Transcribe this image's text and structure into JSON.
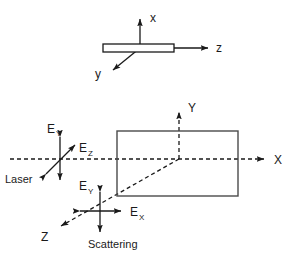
{
  "figure": {
    "background": "#ffffff",
    "ink_color": "#1a1a1a",
    "box_color": "#4a4a4a"
  },
  "panels": {
    "top": {
      "name": "sample-crystal-axes",
      "axes": [
        {
          "key": "x",
          "label": "x",
          "direction": "up"
        },
        {
          "key": "y",
          "label": "y",
          "direction": "down-left"
        },
        {
          "key": "z",
          "label": "z",
          "direction": "right"
        }
      ],
      "sample": {
        "shape": "thin-rectangular-slab"
      }
    },
    "bottom": {
      "name": "laser-scattering-geometry",
      "axes": [
        {
          "key": "X",
          "label": "X",
          "direction": "right",
          "style": "dashed"
        },
        {
          "key": "Y",
          "label": "Y",
          "direction": "up",
          "style": "dashed"
        },
        {
          "key": "Z",
          "label": "Z",
          "direction": "down-left",
          "style": "dashed"
        }
      ],
      "sample_box": {
        "shape": "rectangle"
      },
      "laser": {
        "caption": "Laser",
        "fields": [
          {
            "label_base": "E",
            "label_sub": "Y",
            "orientation": "vertical"
          },
          {
            "label_base": "E",
            "label_sub": "Z",
            "orientation": "diagonal"
          }
        ]
      },
      "scattering": {
        "caption": "Scattering",
        "fields": [
          {
            "label_base": "E",
            "label_sub": "Y",
            "orientation": "vertical"
          },
          {
            "label_base": "E",
            "label_sub": "X",
            "orientation": "horizontal"
          }
        ]
      }
    }
  },
  "labels": {
    "x_lower": "x",
    "y_lower": "y",
    "z_lower": "z",
    "X_upper": "X",
    "Y_upper": "Y",
    "Z_upper": "Z",
    "E": "E",
    "sub_X": "X",
    "sub_Y": "Y",
    "sub_Z": "Z",
    "laser": "Laser",
    "scattering": "Scattering"
  }
}
